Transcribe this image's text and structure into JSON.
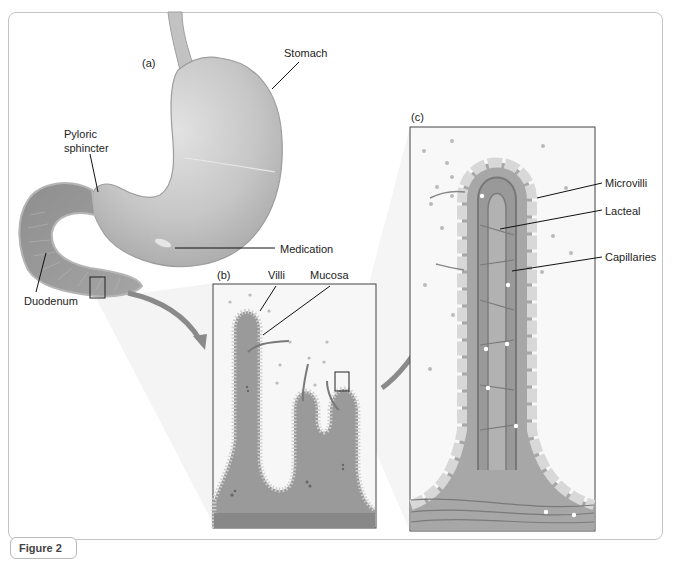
{
  "figure": {
    "caption_tab": "Figure 2",
    "panels": {
      "a": {
        "letter": "(a)",
        "labels": {
          "stomach": "Stomach",
          "pyloric_line1": "Pyloric",
          "pyloric_line2": "sphincter",
          "medication": "Medication",
          "duodenum": "Duodenum"
        }
      },
      "b": {
        "letter": "(b)",
        "labels": {
          "villi": "Villi",
          "mucosa": "Mucosa"
        }
      },
      "c": {
        "letter": "(c)",
        "labels": {
          "microvilli": "Microvilli",
          "lacteal": "Lacteal",
          "capillaries": "Capillaries"
        }
      }
    },
    "colors": {
      "tissue": "#9a9a9a",
      "tissue_dark": "#7d7d7d",
      "stomach": "#c8c8c8",
      "frame": "#c4c4c4",
      "arrow": "#8a8a8a"
    }
  }
}
